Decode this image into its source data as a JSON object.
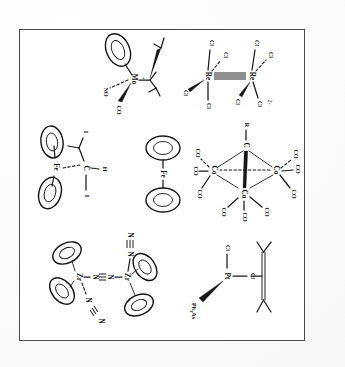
{
  "page": {
    "kind": "scanned-figure-plate",
    "orientation_note": "rotated-90-clockwise",
    "background_color": "#fefefe",
    "border_color": "#4a4a4a",
    "ink_color": "#141414"
  },
  "structures": [
    {
      "id": "mo-cp-co-no",
      "name": "cyclopentadienyl-molybdenum-carbonyl-nitrosyl-cation",
      "metal": "Mo",
      "charge": "+",
      "ligand_labels": [
        "CO",
        "NO"
      ],
      "ring_count": 1,
      "has_tbu": true
    },
    {
      "id": "re2cl8",
      "name": "octachlorodirhenate-quadruple-bond",
      "metal": "Re",
      "charge": "2-",
      "ligand_labels": [
        "Cl",
        "Cl",
        "Cl",
        "Cl",
        "Cl",
        "Cl",
        "Cl",
        "Cl"
      ],
      "metal_labels": [
        "Re",
        "Re"
      ],
      "bond_order_note": "quadruple"
    },
    {
      "id": "cp2-fe-ch-i2",
      "name": "bent-metallocene-with-chi-and-iodide",
      "metal": "Fe",
      "ligand_labels": [
        "I",
        "I",
        "H"
      ],
      "center_label": "C",
      "ring_count": 2
    },
    {
      "id": "ferrocene",
      "name": "ferrocene",
      "metal": "Fe",
      "ring_count": 2
    },
    {
      "id": "co3-cr-co9",
      "name": "methylidyne-tricobalt-nonacarbonyl",
      "metal_labels": [
        "Co",
        "Co",
        "Co"
      ],
      "apex_labels": [
        "R",
        "C"
      ],
      "ligand_labels": [
        "CO",
        "CO",
        "CO",
        "CO",
        "CO",
        "CO",
        "CO",
        "CO",
        "CO"
      ]
    },
    {
      "id": "zr2-n2-bridge",
      "name": "dinitrogen-bridged-bis-cyclopentadienyl-zirconium",
      "metal_labels": [
        "Zr",
        "Zr"
      ],
      "ligand_labels": [
        "N",
        "N",
        "N",
        "N",
        "N",
        "N"
      ],
      "bridge_label": "N",
      "ring_count": 4
    },
    {
      "id": "pt-cl2-as-alkene",
      "name": "platinum-dichloride-triphenylarsine-alkene",
      "metal": "Pt",
      "ligand_labels": [
        "Cl",
        "Cl",
        "Ph3As"
      ],
      "ligand_labels_display": [
        "Cl",
        "Cl",
        "Ph₃As"
      ],
      "alkene_label": "C"
    }
  ]
}
